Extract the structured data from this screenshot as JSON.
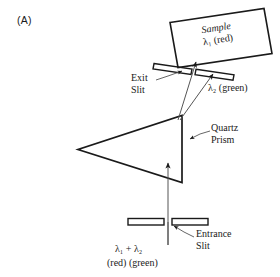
{
  "figure": {
    "panel_tag": "(A)",
    "title_implied": "Prism monochromator optical path",
    "stroke_color": "#1a1a1a",
    "ray_color": "#555555",
    "background": "#ffffff"
  },
  "labels": {
    "sample_line1": "Sample",
    "sample_line2": "λ₁ (red)",
    "exit_slit_line1": "Exit",
    "exit_slit_line2": "Slit",
    "lambda2": "λ₂ (green)",
    "quartz_line1": "Quartz",
    "quartz_line2": "Prism",
    "entrance_line1": "Entrance",
    "entrance_line2": "Slit",
    "lambda_sum": "λ₁ + λ₂",
    "colors_line": "(red)   (green)"
  },
  "components": [
    {
      "name": "sample-cell",
      "shape": "tilted-rectangle",
      "contains": "λ₁ (red)"
    },
    {
      "name": "exit-slit",
      "shape": "two-tilted-bars"
    },
    {
      "name": "quartz-prism",
      "shape": "triangle"
    },
    {
      "name": "entrance-slit",
      "shape": "two-horizontal-bars"
    }
  ],
  "rays": [
    {
      "name": "incident-beam",
      "label": "λ₁ + λ₂",
      "from": "entrance-slit",
      "to": "prism-base"
    },
    {
      "name": "red-ray",
      "label": "λ₁ (red)",
      "from": "prism-apex",
      "to": "sample-cell"
    },
    {
      "name": "green-ray",
      "label": "λ₂ (green)",
      "from": "prism-apex",
      "to": "exit-slit-right"
    }
  ]
}
